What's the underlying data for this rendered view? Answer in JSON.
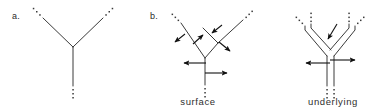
{
  "figure": {
    "background_color": "#ffffff",
    "ink_color": "#3a3a3a",
    "arrow_color": "#111111",
    "panels": [
      {
        "id": "a",
        "label": "a."
      },
      {
        "id": "b",
        "label": "b."
      }
    ],
    "captions": {
      "surface": "surface",
      "underlying": "underlying"
    },
    "diagram_a": {
      "description": "single-line Y tree with ellipsis dots at three branch ends",
      "node": {
        "x": 73,
        "y": 47
      },
      "branches": [
        {
          "name": "left-branch",
          "x1": 73,
          "y1": 47,
          "x2": 43,
          "y2": 18
        },
        {
          "name": "right-branch",
          "x1": 73,
          "y1": 47,
          "x2": 103,
          "y2": 18
        },
        {
          "name": "stem",
          "x1": 73,
          "y1": 47,
          "x2": 73,
          "y2": 86
        }
      ],
      "ellipses": [
        {
          "name": "left-ellipsis",
          "x": 40,
          "y": 15,
          "dx": -3.2,
          "dy": -3.2,
          "count": 3
        },
        {
          "name": "right-ellipsis",
          "x": 106,
          "y": 15,
          "dx": 3.2,
          "dy": -3.2,
          "count": 3
        },
        {
          "name": "stem-ellipsis",
          "x": 73,
          "y": 89,
          "dx": 0,
          "dy": 4.0,
          "count": 3
        }
      ]
    },
    "diagram_surface": {
      "description": "single-line branching tree, nested Y on right branch, six arrows",
      "nodes": [
        {
          "name": "root-node",
          "x": 205,
          "y": 58
        },
        {
          "name": "inner-node",
          "x": 218,
          "y": 43
        }
      ],
      "branches": [
        {
          "name": "outer-left",
          "x1": 205,
          "y1": 58,
          "x2": 181,
          "y2": 23
        },
        {
          "name": "outer-right",
          "x1": 205,
          "y1": 58,
          "x2": 218,
          "y2": 43
        },
        {
          "name": "inner-left",
          "x1": 218,
          "y1": 43,
          "x2": 203,
          "y2": 28
        },
        {
          "name": "inner-right",
          "x1": 218,
          "y1": 43,
          "x2": 243,
          "y2": 20
        },
        {
          "name": "stem",
          "x1": 205,
          "y1": 58,
          "x2": 205,
          "y2": 85
        }
      ],
      "ellipses": [
        {
          "name": "left-ellipsis",
          "x": 178,
          "y": 20,
          "dx": -3.0,
          "dy": -3.0,
          "count": 3
        },
        {
          "name": "right-ellipsis",
          "x": 246,
          "y": 17,
          "dx": 3.0,
          "dy": -3.0,
          "count": 3
        },
        {
          "name": "stem-ellipsis",
          "x": 205,
          "y": 88,
          "dx": 0,
          "dy": 4.0,
          "count": 3
        }
      ],
      "arrows": [
        {
          "name": "arrow-upper-left-outward",
          "x1": 185,
          "y1": 34,
          "x2": 174,
          "y2": 43
        },
        {
          "name": "arrow-upper-left-inward",
          "x1": 193,
          "y1": 44,
          "x2": 204,
          "y2": 34
        },
        {
          "name": "arrow-inner-down-left",
          "x1": 222,
          "y1": 25,
          "x2": 211,
          "y2": 34
        },
        {
          "name": "arrow-inner-down-right",
          "x1": 219,
          "y1": 42,
          "x2": 231,
          "y2": 52
        },
        {
          "name": "arrow-stem-left",
          "x1": 206,
          "y1": 63,
          "x2": 183,
          "y2": 63
        },
        {
          "name": "arrow-stem-right",
          "x1": 205,
          "y1": 73,
          "x2": 228,
          "y2": 73
        }
      ]
    },
    "diagram_underlying": {
      "description": "double-line (parallel) Y tree with three arrows",
      "apex": {
        "x": 330,
        "y": 54
      },
      "rails": [
        {
          "name": "left-branch-rail-outer",
          "points": "305,27 305,29 327,55"
        },
        {
          "name": "left-branch-rail-inner",
          "points": "311,25 311,27 331,50"
        },
        {
          "name": "right-branch-rail-outer",
          "points": "355,27 355,29 333,55"
        },
        {
          "name": "right-branch-rail-inner",
          "points": "349,25 349,27 329,50"
        },
        {
          "name": "stem-rail-left",
          "x1": 327,
          "y1": 55,
          "x2": 327,
          "y2": 86
        },
        {
          "name": "stem-rail-right",
          "x1": 334,
          "y1": 55,
          "x2": 334,
          "y2": 86
        }
      ],
      "ellipses": [
        {
          "name": "left-outer-ellipsis",
          "x": 302,
          "y": 24,
          "dx": -3.0,
          "dy": -3.0,
          "count": 3
        },
        {
          "name": "left-inner-ellipsis",
          "x": 313,
          "y": 22,
          "dx": 0,
          "dy": -3.6,
          "count": 3
        },
        {
          "name": "right-inner-ellipsis",
          "x": 347,
          "y": 22,
          "dx": 0,
          "dy": -3.6,
          "count": 3
        },
        {
          "name": "right-outer-ellipsis",
          "x": 358,
          "y": 24,
          "dx": 3.0,
          "dy": -3.0,
          "count": 3
        },
        {
          "name": "stem-left-ellipsis",
          "x": 327,
          "y": 89,
          "dx": 0,
          "dy": 4.0,
          "count": 3
        },
        {
          "name": "stem-right-ellipsis",
          "x": 334,
          "y": 89,
          "dx": 0,
          "dy": 4.0,
          "count": 3
        }
      ],
      "arrows": [
        {
          "name": "arrow-apex-down",
          "x1": 336,
          "y1": 24,
          "x2": 327,
          "y2": 40
        },
        {
          "name": "arrow-stem-left",
          "x1": 330,
          "y1": 63,
          "x2": 305,
          "y2": 63
        },
        {
          "name": "arrow-stem-right",
          "x1": 330,
          "y1": 60,
          "x2": 356,
          "y2": 60
        }
      ]
    }
  }
}
